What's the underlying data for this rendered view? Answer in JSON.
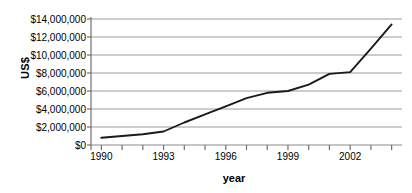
{
  "chart_data": {
    "type": "line",
    "title": "",
    "xlabel": "year",
    "ylabel": "US$",
    "xlim": [
      1989.5,
      2004.5
    ],
    "ylim": [
      0,
      14000000
    ],
    "grid": true,
    "legend": false,
    "y_ticks": [
      0,
      2000000,
      4000000,
      6000000,
      8000000,
      10000000,
      12000000,
      14000000
    ],
    "y_tick_labels": [
      "$0",
      "$2,000,000",
      "$4,000,000",
      "$6,000,000",
      "$8,000,000",
      "$10,000,000",
      "$12,000,000",
      "$14,000,000"
    ],
    "x_ticks": [
      1990,
      1991,
      1992,
      1993,
      1994,
      1995,
      1996,
      1997,
      1998,
      1999,
      2000,
      2001,
      2002,
      2003,
      2004
    ],
    "x_tick_labels_shown": [
      "1990",
      "1993",
      "1996",
      "1999",
      "2002"
    ],
    "x_labeled_values": [
      1990,
      1993,
      1996,
      1999,
      2002
    ],
    "series": [
      {
        "name": "US$",
        "color": "#1a1a1a",
        "x": [
          1990,
          1991,
          1992,
          1993,
          1994,
          1995,
          1996,
          1997,
          1998,
          1999,
          2000,
          2001,
          2002,
          2003,
          2004
        ],
        "values": [
          800000,
          1000000,
          1200000,
          1500000,
          2500000,
          3400000,
          4300000,
          5200000,
          5800000,
          6000000,
          6700000,
          7900000,
          8100000,
          10700000,
          13400000
        ]
      }
    ]
  },
  "axes": {
    "y_axis_title": "US$",
    "x_axis_title": "year"
  }
}
